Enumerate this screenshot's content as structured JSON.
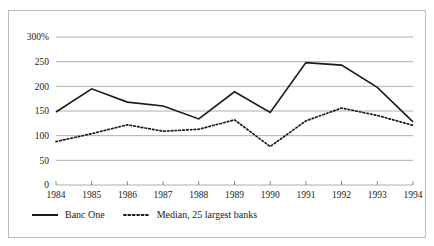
{
  "chart_data": {
    "type": "line",
    "title": "",
    "subtitle": "",
    "xlabel": "",
    "ylabel": "",
    "categories": [
      "1984",
      "1985",
      "1986",
      "1987",
      "1988",
      "1989",
      "1990",
      "1991",
      "1992",
      "1993",
      "1994"
    ],
    "x": [
      1984,
      1985,
      1986,
      1987,
      1988,
      1989,
      1990,
      1991,
      1992,
      1993,
      1994
    ],
    "series": [
      {
        "name": "Banc One",
        "style": "solid",
        "color": "#1a1a1a",
        "values": [
          148,
          195,
          168,
          160,
          134,
          189,
          147,
          248,
          243,
          198,
          128
        ]
      },
      {
        "name": "Median, 25 largest banks",
        "style": "dotted",
        "color": "#1a1a1a",
        "values": [
          88,
          104,
          122,
          109,
          113,
          132,
          78,
          130,
          156,
          141,
          121
        ]
      }
    ],
    "ylim": [
      0,
      300
    ],
    "xlim": [
      1984,
      1994
    ],
    "yticks": [
      0,
      50,
      100,
      150,
      200,
      250,
      300
    ],
    "ytick_labels": [
      "0",
      "50",
      "100",
      "150",
      "200",
      "250",
      "300%"
    ],
    "xticks": [
      1984,
      1985,
      1986,
      1987,
      1988,
      1989,
      1990,
      1991,
      1992,
      1993,
      1994
    ],
    "xtick_labels": [
      "1984",
      "1985",
      "1986",
      "1987",
      "1988",
      "1989",
      "1990",
      "1991",
      "1992",
      "1993",
      "1994"
    ],
    "grid": true,
    "grid_axis": "y",
    "legend_position": "bottom-left",
    "unit": "percent"
  },
  "legend": {
    "entries": [
      {
        "label": "Banc One",
        "style": "solid"
      },
      {
        "label": "Median, 25 largest banks",
        "style": "dotted"
      }
    ]
  },
  "colors": {
    "line": "#1a1a1a",
    "grid": "#9a9a9a",
    "border": "#bbbbbb",
    "background": "#ffffff"
  }
}
